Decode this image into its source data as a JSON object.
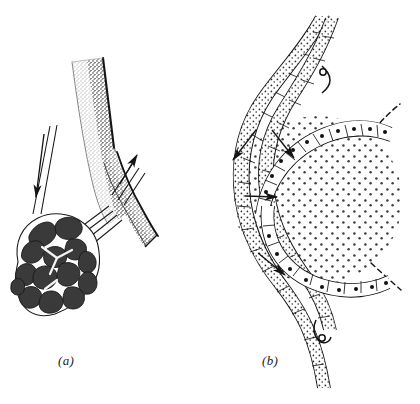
{
  "figure": {
    "background_color": "#ffffff",
    "ink_color": "#141414",
    "panels": [
      {
        "id": "a",
        "caption": "(a)",
        "caption_position": {
          "x": 58,
          "y": 353
        },
        "description": "Branching vessel with stippled shading bearing a lobulated dark glomus cluster at its lower end",
        "elements": {
          "vessel_trunk_label": "branching vessel trunk",
          "vessel_branch_label": "vessel side branch",
          "glomus_cluster_label": "lobulated glomus cluster",
          "lobule_fill_color": "#3a3a3a",
          "lobule_gap_color": "#ffffff",
          "stipple_color": "#2b2b2b",
          "arrows": [
            {
              "name": "inflow-arrow-left",
              "direction": "down",
              "x1": 44,
              "y1": 136,
              "x2": 36,
              "y2": 200
            },
            {
              "name": "outflow-arrow-right",
              "direction": "up-right",
              "x1": 120,
              "y1": 183,
              "x2": 136,
              "y2": 152
            }
          ]
        }
      },
      {
        "id": "b",
        "caption": "(b)",
        "caption_position": {
          "x": 262,
          "y": 353
        },
        "description": "Sectional view of a coiled vessel wall with cellular lining enclosing a large stippled spherical mass",
        "elements": {
          "vessel_wall_label": "vessel wall with endothelial cells",
          "lumen_label": "stippled spherical lumen mass",
          "nucleus_dot_color": "#111111",
          "stipple_color": "#3d3d3d",
          "dashed_edge_label": "dashed continuation of sphere outline",
          "arrows": [
            {
              "name": "flow-arrow-outer",
              "direction": "down-left",
              "x1": 254,
              "y1": 131,
              "x2": 232,
              "y2": 158
            },
            {
              "name": "flow-arrow-upper-inner",
              "direction": "down-right",
              "x1": 272,
              "y1": 131,
              "x2": 293,
              "y2": 157
            },
            {
              "name": "flow-arrow-middle",
              "direction": "right",
              "x1": 244,
              "y1": 195,
              "x2": 278,
              "y2": 196
            },
            {
              "name": "flow-arrow-lower",
              "direction": "down-right",
              "x1": 258,
              "y1": 253,
              "x2": 286,
              "y2": 274
            }
          ]
        }
      }
    ]
  }
}
